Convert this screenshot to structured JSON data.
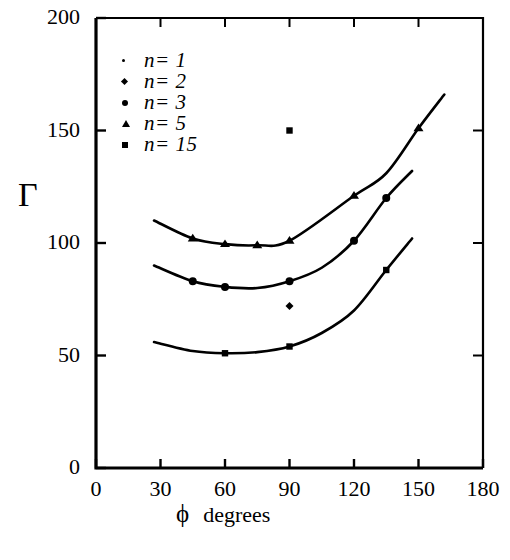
{
  "chart_data": {
    "type": "line",
    "title": "",
    "xlabel": "ϕ  degrees",
    "ylabel": "Γ",
    "xlim": [
      0,
      180
    ],
    "ylim": [
      0,
      200
    ],
    "xticks": [
      0,
      30,
      60,
      90,
      120,
      150,
      180
    ],
    "yticks": [
      0,
      50,
      100,
      150,
      200
    ],
    "grid": false,
    "legend_position": "top-left-inside",
    "legend": [
      {
        "label": "n= 1",
        "marker": "tiny-dot"
      },
      {
        "label": "n= 2",
        "marker": "small-diamond"
      },
      {
        "label": "n= 3",
        "marker": "round-dot"
      },
      {
        "label": "n= 5",
        "marker": "triangle"
      },
      {
        "label": "n= 15",
        "marker": "square"
      }
    ],
    "series": [
      {
        "name": "n= 5",
        "marker": "triangle",
        "line": true,
        "x": [
          27,
          45,
          60,
          75,
          90,
          120,
          135,
          150,
          162
        ],
        "y": [
          110,
          102,
          99.5,
          99,
          101,
          121,
          131,
          151,
          166
        ],
        "marker_points": [
          {
            "x": 45,
            "y": 102
          },
          {
            "x": 60,
            "y": 99.5
          },
          {
            "x": 75,
            "y": 99
          },
          {
            "x": 90,
            "y": 101
          },
          {
            "x": 120,
            "y": 121
          },
          {
            "x": 150,
            "y": 151
          }
        ]
      },
      {
        "name": "n= 3",
        "marker": "round-dot",
        "line": true,
        "x": [
          27,
          45,
          60,
          75,
          90,
          105,
          120,
          135,
          147
        ],
        "y": [
          90,
          83,
          80.5,
          80,
          83,
          89,
          101,
          120,
          132
        ],
        "marker_points": [
          {
            "x": 45,
            "y": 83
          },
          {
            "x": 60,
            "y": 80.5
          },
          {
            "x": 90,
            "y": 83
          },
          {
            "x": 120,
            "y": 101
          },
          {
            "x": 135,
            "y": 120
          }
        ]
      },
      {
        "name": "n= 15",
        "marker": "square",
        "line": true,
        "x": [
          27,
          45,
          60,
          75,
          90,
          105,
          120,
          135,
          147
        ],
        "y": [
          56,
          52,
          51,
          51.5,
          54,
          60,
          70,
          88,
          102
        ],
        "marker_points": [
          {
            "x": 60,
            "y": 51
          },
          {
            "x": 90,
            "y": 54
          },
          {
            "x": 135,
            "y": 88
          }
        ]
      }
    ],
    "isolated_points": [
      {
        "name": "n= 15",
        "marker": "square",
        "x": 90,
        "y": 150
      },
      {
        "name": "n= 2",
        "marker": "small-diamond",
        "x": 90,
        "y": 72
      }
    ],
    "ytick_labels": [
      "0",
      "50",
      "100",
      "150",
      "200"
    ],
    "xtick_labels": [
      "0",
      "30",
      "60",
      "90",
      "120",
      "150",
      "180"
    ],
    "colors": {
      "line": "#000000",
      "axis": "#000000",
      "background": "#ffffff"
    }
  },
  "axis": {
    "y_title": "Γ",
    "x_title_symbol": "ϕ",
    "x_title_unit": "degrees"
  }
}
